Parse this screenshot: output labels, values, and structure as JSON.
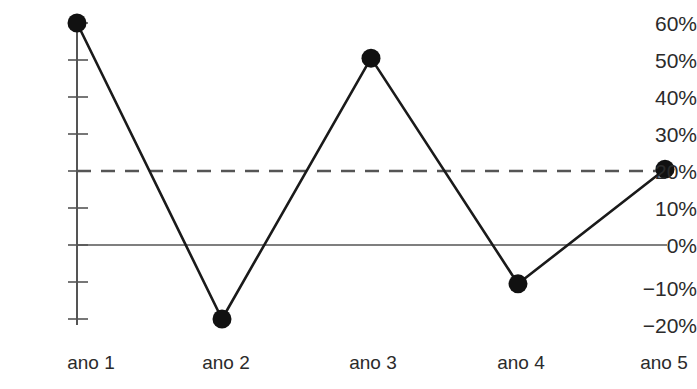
{
  "chart_data": {
    "type": "line",
    "title": "",
    "subtitle": "",
    "xlabel": "",
    "ylabel": "",
    "categories": [
      "ano 1",
      "ano 2",
      "ano 3",
      "ano 4",
      "ano 5"
    ],
    "series": [
      {
        "name": "",
        "values": [
          60,
          -20,
          50.5,
          -10.5,
          20.5
        ],
        "marker": "filled-circle",
        "marker_color": "#111111",
        "line_color": "#1a1a1a",
        "line_style": "solid"
      }
    ],
    "reference_lines": [
      {
        "name": "dashed-reference-line",
        "value": 20,
        "style": "dashed",
        "color": "#555555"
      },
      {
        "name": "zero-line",
        "value": 0,
        "style": "solid",
        "color": "#555555"
      }
    ],
    "ylim": [
      -20,
      60
    ],
    "ytick_values": [
      60,
      50,
      40,
      30,
      20,
      10,
      0,
      -10,
      -20
    ],
    "ytick_labels": [
      "60%",
      "50%",
      "40%",
      "30%",
      "20%",
      "10%",
      "0%",
      "−10%",
      "−20%"
    ],
    "xtick_labels": [
      "ano 1",
      "ano 2",
      "ano 3",
      "ano 4",
      "ano 5"
    ],
    "grid": false,
    "legend": null,
    "legend_position": "none",
    "background_color": "#ffffff",
    "axis_color": "#555555"
  }
}
